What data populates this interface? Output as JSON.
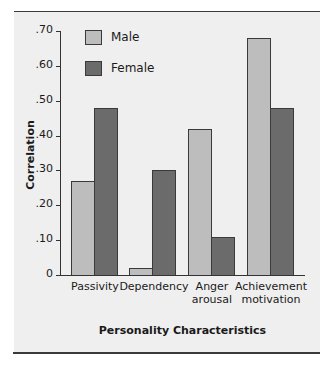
{
  "chart_data": {
    "type": "bar",
    "title": "",
    "xlabel": "Personality Characteristics",
    "ylabel": "Correlation",
    "ylim": [
      0,
      0.7
    ],
    "yticks": [
      0,
      0.1,
      0.2,
      0.3,
      0.4,
      0.5,
      0.6,
      0.7
    ],
    "ytick_labels": [
      "0",
      ".10",
      ".20",
      ".30",
      ".40",
      ".50",
      ".60",
      ".70"
    ],
    "categories": [
      "Passivity",
      "Dependency",
      "Anger arousal",
      "Achievement motivation"
    ],
    "category_lines": [
      [
        "Passivity"
      ],
      [
        "Dependency"
      ],
      [
        "Anger",
        "arousal"
      ],
      [
        "Achievement",
        "motivation"
      ]
    ],
    "series": [
      {
        "name": "Male",
        "color": "#bdbdbd",
        "values": [
          0.27,
          0.02,
          0.42,
          0.68
        ]
      },
      {
        "name": "Female",
        "color": "#6b6b6b",
        "values": [
          0.48,
          0.3,
          0.11,
          0.48
        ]
      }
    ],
    "legend_position": "upper-left",
    "grid": false
  }
}
